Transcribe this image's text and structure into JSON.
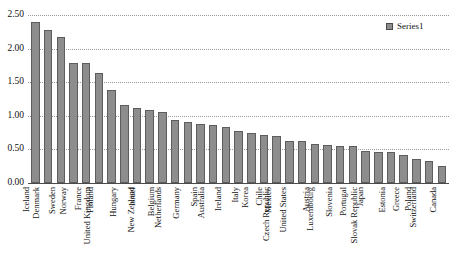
{
  "chart_data": {
    "type": "bar",
    "title": "",
    "subtitle": "",
    "xlabel": "",
    "ylabel": "",
    "ylim": [
      0.0,
      2.5
    ],
    "ytick_labels": [
      "2.50",
      "2.00",
      "1.50",
      "1.00",
      "0.50",
      "0.00"
    ],
    "ytick_values": [
      2.5,
      2.0,
      1.5,
      1.0,
      0.5,
      0.0
    ],
    "grid": true,
    "grid_style": "dotted-horizontal",
    "legend_position": "top-right",
    "series": [
      {
        "name": "Series1",
        "color": "#8d8d8d",
        "values": [
          2.4,
          2.28,
          2.17,
          1.79,
          1.78,
          1.63,
          1.38,
          1.16,
          1.12,
          1.09,
          1.05,
          0.94,
          0.91,
          0.88,
          0.86,
          0.84,
          0.78,
          0.75,
          0.72,
          0.7,
          0.62,
          0.62,
          0.58,
          0.56,
          0.55,
          0.55,
          0.48,
          0.46,
          0.46,
          0.42,
          0.36,
          0.33,
          0.25
        ]
      }
    ],
    "categories": [
      "Iceland",
      "Denmark",
      "Sweden",
      "Norway",
      "France",
      "Finland",
      "United Kingdom",
      "Hungary",
      "Israel",
      "New Zealand",
      "Belgium",
      "Netherlands",
      "Germany",
      "Spain",
      "Australia",
      "Ireland",
      "Italy",
      "Korea",
      "Chile",
      "Mexico",
      "Czech Republic",
      "United States",
      "Austria",
      "Luxembourg",
      "Slovenia",
      "Portugal",
      "Japan",
      "Slovak Republic",
      "Estonia",
      "Greece",
      "Poland",
      "Switzerland",
      "Canada"
    ]
  },
  "legend": {
    "entries": [
      {
        "label": "Series1",
        "color": "#8d8d8d"
      }
    ]
  },
  "colors": {
    "bar_fill": "#8d8d8d",
    "bar_stroke": "#5d5d5d",
    "axis": "#4a4a4a",
    "grid": "#9a9a9a",
    "text": "#111111",
    "background": "#ffffff"
  }
}
